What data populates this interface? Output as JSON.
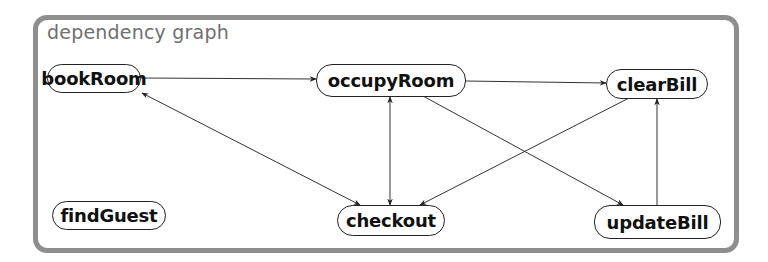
{
  "diagram": {
    "title": "dependency graph",
    "nodes": [
      {
        "id": "bookRoom",
        "label": "bookRoom"
      },
      {
        "id": "occupyRoom",
        "label": "occupyRoom"
      },
      {
        "id": "clearBill",
        "label": "clearBill"
      },
      {
        "id": "findGuest",
        "label": "findGuest"
      },
      {
        "id": "checkout",
        "label": "checkout"
      },
      {
        "id": "updateBill",
        "label": "updateBill"
      }
    ],
    "edges": [
      {
        "from": "bookRoom",
        "to": "occupyRoom",
        "direction": "forward"
      },
      {
        "from": "occupyRoom",
        "to": "clearBill",
        "direction": "forward"
      },
      {
        "from": "bookRoom",
        "to": "checkout",
        "direction": "both"
      },
      {
        "from": "occupyRoom",
        "to": "checkout",
        "direction": "both"
      },
      {
        "from": "occupyRoom",
        "to": "updateBill",
        "direction": "forward"
      },
      {
        "from": "clearBill",
        "to": "checkout",
        "direction": "forward"
      },
      {
        "from": "updateBill",
        "to": "clearBill",
        "direction": "forward"
      }
    ],
    "colors": {
      "frame_border": "#8e8e8e",
      "title_text": "#6f6f6f",
      "node_border": "#222222",
      "edge": "#333333"
    }
  }
}
